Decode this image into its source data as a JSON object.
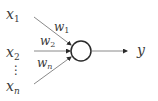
{
  "diagram": {
    "title": "",
    "type": "perceptron",
    "inputs": [
      {
        "name": "x",
        "sub": "1"
      },
      {
        "name": "x",
        "sub": "2"
      },
      {
        "name": "x",
        "sub": "n"
      }
    ],
    "ellipsis": "⋮",
    "weights": [
      {
        "name": "w",
        "sub": "1"
      },
      {
        "name": "w",
        "sub": "2"
      },
      {
        "name": "w",
        "sub": "n"
      }
    ],
    "node": "neuron-circle",
    "output": "y",
    "colors": {
      "line": "#7a7a7a",
      "circle": "#2a2a2a",
      "text": "#3a3a3a"
    }
  }
}
